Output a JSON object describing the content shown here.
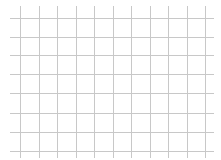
{
  "grid": {
    "background": "#ffffff",
    "line_color": "#c8c8c8",
    "vertical_lines_x": [
      20,
      39,
      57,
      76,
      94,
      113,
      131,
      150,
      168,
      187,
      205
    ],
    "horizontal_lines_y": [
      18,
      37,
      55,
      74,
      93,
      113,
      132,
      151
    ],
    "vertical_extent": [
      6,
      158
    ],
    "horizontal_extent": [
      10,
      214
    ]
  }
}
